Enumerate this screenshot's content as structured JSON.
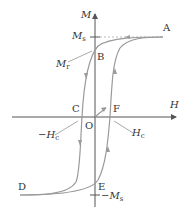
{
  "diagram": {
    "type": "hysteresis-loop",
    "axes": {
      "x_label": "H",
      "y_label": "M",
      "origin_label": "O"
    },
    "points": {
      "A": "A",
      "B": "B",
      "C": "C",
      "D": "D",
      "E": "E",
      "F": "F"
    },
    "annotations": {
      "saturation_pos": {
        "sym": "M",
        "sub": "s"
      },
      "saturation_neg": {
        "prefix": "−",
        "sym": "M",
        "sub": "s"
      },
      "remanence": {
        "sym": "M",
        "sub": "r"
      },
      "coercivity_pos": {
        "sym": "H",
        "sub": "c"
      },
      "coercivity_neg": {
        "prefix": "−",
        "sym": "H",
        "sub": "c"
      }
    },
    "colors": {
      "axis": "#555555",
      "curve": "#9a9a9a",
      "text": "#333333"
    }
  }
}
